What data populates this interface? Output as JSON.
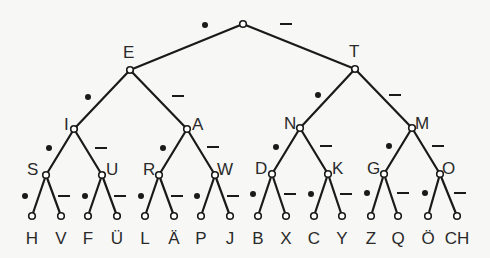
{
  "legend": {
    "left_branch": "dot",
    "right_branch": "dash"
  },
  "root": {
    "label": "",
    "x": 243,
    "y": 24
  },
  "nodes": [
    {
      "id": "E",
      "label": "E",
      "parent": "root",
      "x": 130,
      "y": 70,
      "lx": 123,
      "ly": 58,
      "mark": "dot",
      "mx": 205,
      "my": 25
    },
    {
      "id": "T",
      "label": "T",
      "parent": "root",
      "x": 355,
      "y": 69,
      "lx": 349,
      "ly": 57,
      "mark": "dash",
      "mx": 286,
      "my": 24
    },
    {
      "id": "I",
      "label": "I",
      "parent": "E",
      "x": 74,
      "y": 129,
      "lx": 64,
      "ly": 130,
      "mark": "dot",
      "mx": 88,
      "my": 97
    },
    {
      "id": "A",
      "label": "A",
      "parent": "E",
      "x": 187,
      "y": 129,
      "lx": 192,
      "ly": 130,
      "mark": "dash",
      "mx": 178,
      "my": 96
    },
    {
      "id": "N",
      "label": "N",
      "parent": "T",
      "x": 300,
      "y": 128,
      "lx": 284,
      "ly": 129,
      "mark": "dot",
      "mx": 318,
      "my": 95
    },
    {
      "id": "M",
      "label": "M",
      "parent": "T",
      "x": 412,
      "y": 128,
      "lx": 415,
      "ly": 129,
      "mark": "dash",
      "mx": 395,
      "my": 95
    },
    {
      "id": "S",
      "label": "S",
      "parent": "I",
      "x": 46,
      "y": 175,
      "lx": 27,
      "ly": 175,
      "mark": "dot",
      "mx": 49,
      "my": 148
    },
    {
      "id": "U",
      "label": "U",
      "parent": "I",
      "x": 102,
      "y": 175,
      "lx": 106,
      "ly": 175,
      "mark": "dash",
      "mx": 101,
      "my": 148
    },
    {
      "id": "R",
      "label": "R",
      "parent": "A",
      "x": 159,
      "y": 175,
      "lx": 143,
      "ly": 175,
      "mark": "dot",
      "mx": 163,
      "my": 148
    },
    {
      "id": "W",
      "label": "W",
      "parent": "A",
      "x": 215,
      "y": 175,
      "lx": 217,
      "ly": 175,
      "mark": "dash",
      "mx": 213,
      "my": 147
    },
    {
      "id": "D",
      "label": "D",
      "parent": "N",
      "x": 272,
      "y": 174,
      "lx": 255,
      "ly": 174,
      "mark": "dot",
      "mx": 276,
      "my": 147
    },
    {
      "id": "K",
      "label": "K",
      "parent": "N",
      "x": 328,
      "y": 174,
      "lx": 332,
      "ly": 174,
      "mark": "dash",
      "mx": 326,
      "my": 146
    },
    {
      "id": "G",
      "label": "G",
      "parent": "M",
      "x": 384,
      "y": 174,
      "lx": 367,
      "ly": 174,
      "mark": "dot",
      "mx": 389,
      "my": 146
    },
    {
      "id": "O",
      "label": "O",
      "parent": "M",
      "x": 440,
      "y": 174,
      "lx": 442,
      "ly": 174,
      "mark": "dash",
      "mx": 438,
      "my": 146
    }
  ],
  "leaves": [
    {
      "label": "H",
      "parent": "S",
      "x": 32,
      "mark": "dot",
      "mx": 25,
      "my": 196
    },
    {
      "label": "V",
      "parent": "S",
      "x": 61,
      "mark": "dash",
      "mx": 64,
      "my": 196
    },
    {
      "label": "F",
      "parent": "U",
      "x": 88,
      "mark": "dot",
      "mx": 85,
      "my": 196
    },
    {
      "label": "Ü",
      "parent": "U",
      "x": 117,
      "mark": "dash",
      "mx": 120,
      "my": 196
    },
    {
      "label": "L",
      "parent": "R",
      "x": 145,
      "mark": "dot",
      "mx": 141,
      "my": 196
    },
    {
      "label": "Ä",
      "parent": "R",
      "x": 174,
      "mark": "dash",
      "mx": 177,
      "my": 196
    },
    {
      "label": "P",
      "parent": "W",
      "x": 201,
      "mark": "dot",
      "mx": 197,
      "my": 196
    },
    {
      "label": "J",
      "parent": "W",
      "x": 230,
      "mark": "dash",
      "mx": 233,
      "my": 196
    },
    {
      "label": "B",
      "parent": "D",
      "x": 258,
      "mark": "dot",
      "mx": 253,
      "my": 194
    },
    {
      "label": "X",
      "parent": "D",
      "x": 286,
      "mark": "dash",
      "mx": 290,
      "my": 194
    },
    {
      "label": "C",
      "parent": "K",
      "x": 314,
      "mark": "dot",
      "mx": 311,
      "my": 194
    },
    {
      "label": "Y",
      "parent": "K",
      "x": 342,
      "mark": "dash",
      "mx": 346,
      "my": 194
    },
    {
      "label": "Z",
      "parent": "G",
      "x": 371,
      "mark": "dot",
      "mx": 367,
      "my": 193
    },
    {
      "label": "Q",
      "parent": "G",
      "x": 398,
      "mark": "dash",
      "mx": 403,
      "my": 193
    },
    {
      "label": "Ö",
      "parent": "O",
      "x": 428,
      "mark": "dot",
      "mx": 425,
      "my": 193
    },
    {
      "label": "CH",
      "parent": "O",
      "x": 457,
      "mark": "dash",
      "mx": 460,
      "my": 193
    }
  ],
  "leaf_y": 216,
  "leaf_label_y": 244,
  "colors": {
    "ink": "#1a1a1a",
    "background": "#f7f7f5",
    "node_fill": "#ffffff"
  }
}
